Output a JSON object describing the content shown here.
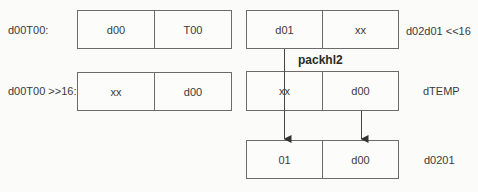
{
  "diagram": {
    "operation": "packhl2",
    "registers": [
      {
        "id": "d00T00",
        "label": "d00T00:",
        "cells": [
          "d00",
          "T00"
        ]
      },
      {
        "id": "d00T00_shr16",
        "label": "d00T00 >>16:",
        "cells": [
          "xx",
          "d00"
        ]
      },
      {
        "id": "d02d01_shl16",
        "label": "d02d01 <<16",
        "cells": [
          "d01",
          "xx"
        ]
      },
      {
        "id": "dTEMP",
        "label": "dTEMP",
        "cells": [
          "xx",
          "d00"
        ]
      },
      {
        "id": "d0201",
        "label": "d0201",
        "cells": [
          "01",
          "d00"
        ]
      }
    ],
    "connections": [
      {
        "from": "d02d01_shl16.cell0",
        "to": "d0201.cell0",
        "style": "line-through-dTEMP-then-arrow"
      },
      {
        "from": "dTEMP.cell1",
        "to": "d0201.cell1",
        "style": "arrow"
      }
    ],
    "colors": {
      "background": "#fbfbfa",
      "border": "#6b6b6b",
      "text": "#3a3a3a",
      "arrow": "#333333"
    }
  }
}
